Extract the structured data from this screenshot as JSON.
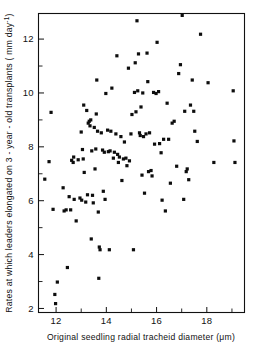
{
  "chart_data": {
    "type": "scatter",
    "title": "",
    "xlabel": "Original seedling radial tracheid diameter (μm)",
    "ylabel": "Rates at which leaders elongated on 3 - year - old  transplants ( mm day⁻¹)",
    "xlim": [
      11.3,
      19.5
    ],
    "ylim": [
      1.85,
      12.95
    ],
    "xticks": [
      12,
      14,
      16,
      18
    ],
    "xticklabels": [
      "12",
      "14",
      "16",
      "18"
    ],
    "xticks_minor": [
      13,
      15,
      17,
      19
    ],
    "yticks": [
      2,
      4,
      6,
      8,
      10,
      12
    ],
    "yticklabels": [
      "2",
      "4",
      "6",
      "8",
      "10",
      "12"
    ],
    "yticks_minor": [
      3,
      5,
      7,
      9,
      11
    ],
    "grid": false,
    "legend": null,
    "marker": "square",
    "marker_color": "#0d0d0d",
    "marker_size": 3.2,
    "n_points": 134,
    "points": [
      [
        11.55,
        6.8
      ],
      [
        11.72,
        7.45
      ],
      [
        11.8,
        9.28
      ],
      [
        11.88,
        5.68
      ],
      [
        11.95,
        2.52
      ],
      [
        11.98,
        2.18
      ],
      [
        12.05,
        2.98
      ],
      [
        12.28,
        6.48
      ],
      [
        12.32,
        5.62
      ],
      [
        12.4,
        5.66
      ],
      [
        12.45,
        3.52
      ],
      [
        12.52,
        6.15
      ],
      [
        12.58,
        5.66
      ],
      [
        12.62,
        7.5
      ],
      [
        12.68,
        7.42
      ],
      [
        12.7,
        7.62
      ],
      [
        12.72,
        6.05
      ],
      [
        12.8,
        5.25
      ],
      [
        12.88,
        7.52
      ],
      [
        12.95,
        6.1
      ],
      [
        13.0,
        8.55
      ],
      [
        13.02,
        6.02
      ],
      [
        13.05,
        7.9
      ],
      [
        13.08,
        7.55
      ],
      [
        13.1,
        9.55
      ],
      [
        13.12,
        7.05
      ],
      [
        13.18,
        5.95
      ],
      [
        13.22,
        9.35
      ],
      [
        13.25,
        6.22
      ],
      [
        13.28,
        8.88
      ],
      [
        13.32,
        8.95
      ],
      [
        13.35,
        8.78
      ],
      [
        13.38,
        9.0
      ],
      [
        13.4,
        4.58
      ],
      [
        13.42,
        7.85
      ],
      [
        13.45,
        6.2
      ],
      [
        13.48,
        5.92
      ],
      [
        13.52,
        8.72
      ],
      [
        13.55,
        7.18
      ],
      [
        13.58,
        7.92
      ],
      [
        13.6,
        9.22
      ],
      [
        13.62,
        10.48
      ],
      [
        13.65,
        8.58
      ],
      [
        13.68,
        5.58
      ],
      [
        13.7,
        3.12
      ],
      [
        13.72,
        4.28
      ],
      [
        13.75,
        4.18
      ],
      [
        13.8,
        8.52
      ],
      [
        13.85,
        7.88
      ],
      [
        13.88,
        6.35
      ],
      [
        13.92,
        7.8
      ],
      [
        13.95,
        6.05
      ],
      [
        13.98,
        9.98
      ],
      [
        14.05,
        8.62
      ],
      [
        14.08,
        7.82
      ],
      [
        14.12,
        4.18
      ],
      [
        14.15,
        7.85
      ],
      [
        14.18,
        8.58
      ],
      [
        14.22,
        10.18
      ],
      [
        14.28,
        7.58
      ],
      [
        14.32,
        7.8
      ],
      [
        14.38,
        8.48
      ],
      [
        14.42,
        11.38
      ],
      [
        14.45,
        7.72
      ],
      [
        14.48,
        7.42
      ],
      [
        14.52,
        7.62
      ],
      [
        14.58,
        8.38
      ],
      [
        14.62,
        6.75
      ],
      [
        14.68,
        7.55
      ],
      [
        14.72,
        8.18
      ],
      [
        14.78,
        7.58
      ],
      [
        14.82,
        7.3
      ],
      [
        14.88,
        10.92
      ],
      [
        14.92,
        7.48
      ],
      [
        14.98,
        8.48
      ],
      [
        15.02,
        9.2
      ],
      [
        15.08,
        4.18
      ],
      [
        15.12,
        10.02
      ],
      [
        15.15,
        11.12
      ],
      [
        15.18,
        9.3
      ],
      [
        15.22,
        12.68
      ],
      [
        15.25,
        10.08
      ],
      [
        15.28,
        11.45
      ],
      [
        15.32,
        8.52
      ],
      [
        15.35,
        8.42
      ],
      [
        15.38,
        9.48
      ],
      [
        15.42,
        6.95
      ],
      [
        15.45,
        10.0
      ],
      [
        15.48,
        8.38
      ],
      [
        15.52,
        6.28
      ],
      [
        15.58,
        8.48
      ],
      [
        15.62,
        11.48
      ],
      [
        15.65,
        10.42
      ],
      [
        15.68,
        7.08
      ],
      [
        15.72,
        8.52
      ],
      [
        15.78,
        7.12
      ],
      [
        15.82,
        6.92
      ],
      [
        15.88,
        10.02
      ],
      [
        15.92,
        8.1
      ],
      [
        15.98,
        9.98
      ],
      [
        16.02,
        11.88
      ],
      [
        16.08,
        10.05
      ],
      [
        16.12,
        8.12
      ],
      [
        16.18,
        7.78
      ],
      [
        16.22,
        6.02
      ],
      [
        16.28,
        8.28
      ],
      [
        16.35,
        5.62
      ],
      [
        16.42,
        9.62
      ],
      [
        16.48,
        8.28
      ],
      [
        16.55,
        6.65
      ],
      [
        16.62,
        8.88
      ],
      [
        16.7,
        8.95
      ],
      [
        16.8,
        7.28
      ],
      [
        16.88,
        10.72
      ],
      [
        16.95,
        11.05
      ],
      [
        17.02,
        12.88
      ],
      [
        17.08,
        6.05
      ],
      [
        17.12,
        9.32
      ],
      [
        17.18,
        7.08
      ],
      [
        17.22,
        7.18
      ],
      [
        17.28,
        6.78
      ],
      [
        17.35,
        9.55
      ],
      [
        17.42,
        10.48
      ],
      [
        17.48,
        9.32
      ],
      [
        17.52,
        8.58
      ],
      [
        17.62,
        8.2
      ],
      [
        17.75,
        12.18
      ],
      [
        18.05,
        10.38
      ],
      [
        18.28,
        7.42
      ],
      [
        19.05,
        10.08
      ],
      [
        19.08,
        8.22
      ],
      [
        19.12,
        7.42
      ]
    ]
  },
  "axes": {
    "x_label_text": "Original  seedling  radial  tracheid  diameter  (μm)",
    "y_label_parts": {
      "main": "Rates at which leaders elongated on 3 - year - old  transplants ( mm day",
      "sup": "-1",
      "tail": ")"
    }
  }
}
